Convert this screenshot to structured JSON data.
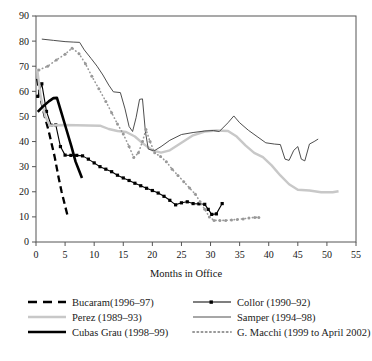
{
  "chart_data": {
    "type": "line",
    "title": "",
    "xlabel": "Months in Office",
    "ylabel": "",
    "xlim": [
      0,
      55
    ],
    "ylim": [
      0,
      90
    ],
    "xticks": [
      0,
      5,
      10,
      15,
      20,
      25,
      30,
      35,
      40,
      45,
      50,
      55
    ],
    "yticks": [
      0,
      10,
      20,
      30,
      40,
      50,
      60,
      70,
      80,
      90
    ],
    "grid": false,
    "legend_position": "below-axis",
    "series": [
      {
        "name": "Bucaram (1996–97)",
        "label": "Bucaram(1996–97)",
        "style": "dashed",
        "color": "#000000",
        "marker": "none",
        "width": 2.3,
        "points": [
          [
            0.2,
            65.0
          ],
          [
            0.7,
            58.0
          ],
          [
            1.5,
            50.0
          ],
          [
            2.2,
            44.0
          ],
          [
            3.2,
            34.0
          ],
          [
            3.9,
            25.5
          ],
          [
            4.4,
            20.0
          ],
          [
            5.1,
            13.5
          ],
          [
            5.5,
            9.8
          ]
        ]
      },
      {
        "name": "Collor (1990–92)",
        "label": "Collor (1990–92)",
        "style": "solid",
        "color": "#000000",
        "marker": "square",
        "width": 1.1,
        "points": [
          [
            0.3,
            58.0
          ],
          [
            1.0,
            63.0
          ],
          [
            1.8,
            52.0
          ],
          [
            2.6,
            46.5
          ],
          [
            3.4,
            46.6
          ],
          [
            4.2,
            38.0
          ],
          [
            5.0,
            34.6
          ],
          [
            6.0,
            34.5
          ],
          [
            7.0,
            34.5
          ],
          [
            8.0,
            34.3
          ],
          [
            9.0,
            33.0
          ],
          [
            10.0,
            31.5
          ],
          [
            11.0,
            30.0
          ],
          [
            12.0,
            29.0
          ],
          [
            13.0,
            28.0
          ],
          [
            14.0,
            26.6
          ],
          [
            15.0,
            25.5
          ],
          [
            16.0,
            24.5
          ],
          [
            17.0,
            23.4
          ],
          [
            18.0,
            22.4
          ],
          [
            19.0,
            21.4
          ],
          [
            20.0,
            20.5
          ],
          [
            21.0,
            19.5
          ],
          [
            22.0,
            18.2
          ],
          [
            23.0,
            16.6
          ],
          [
            24.0,
            14.8
          ],
          [
            25.0,
            15.6
          ],
          [
            26.0,
            16.0
          ],
          [
            27.0,
            15.3
          ],
          [
            28.0,
            15.2
          ],
          [
            29.0,
            15.0
          ],
          [
            29.6,
            13.0
          ],
          [
            30.2,
            11.0
          ],
          [
            31.0,
            11.2
          ],
          [
            32.0,
            15.3
          ]
        ]
      },
      {
        "name": "Perez (1989–93)",
        "label": "Perez (1989–93)",
        "style": "solid",
        "color": "#c8c8c8",
        "marker": "none",
        "width": 2.4,
        "points": [
          [
            0.2,
            69.0
          ],
          [
            0.8,
            58.0
          ],
          [
            1.6,
            50.0
          ],
          [
            2.4,
            46.3
          ],
          [
            3.5,
            46.5
          ],
          [
            5.0,
            46.6
          ],
          [
            7.0,
            46.5
          ],
          [
            9.0,
            46.4
          ],
          [
            11.0,
            46.3
          ],
          [
            12.5,
            45.0
          ],
          [
            14.0,
            44.2
          ],
          [
            15.5,
            43.8
          ],
          [
            17.0,
            42.0
          ],
          [
            18.5,
            39.0
          ],
          [
            20.0,
            36.5
          ],
          [
            21.5,
            35.6
          ],
          [
            23.0,
            36.5
          ],
          [
            25.0,
            39.5
          ],
          [
            27.0,
            42.5
          ],
          [
            29.0,
            44.0
          ],
          [
            31.0,
            44.4
          ],
          [
            33.0,
            44.2
          ],
          [
            34.5,
            42.0
          ],
          [
            36.0,
            38.5
          ],
          [
            37.5,
            35.5
          ],
          [
            39.0,
            33.8
          ],
          [
            40.5,
            30.5
          ],
          [
            42.0,
            26.5
          ],
          [
            43.5,
            23.0
          ],
          [
            45.0,
            20.8
          ],
          [
            47.0,
            20.5
          ],
          [
            49.0,
            19.8
          ],
          [
            51.0,
            19.8
          ],
          [
            52.0,
            20.2
          ]
        ]
      },
      {
        "name": "Samper (1994–98)",
        "label": "Samper (1994–98)",
        "style": "solid",
        "color": "#3a3a3a",
        "marker": "none",
        "width": 0.9,
        "points": [
          [
            1.0,
            80.8
          ],
          [
            3.0,
            80.3
          ],
          [
            5.0,
            79.8
          ],
          [
            6.5,
            79.6
          ],
          [
            7.5,
            79.5
          ],
          [
            8.3,
            76.5
          ],
          [
            9.5,
            73.0
          ],
          [
            10.5,
            70.0
          ],
          [
            11.5,
            66.5
          ],
          [
            12.5,
            62.5
          ],
          [
            13.3,
            59.8
          ],
          [
            14.5,
            59.5
          ],
          [
            15.3,
            53.0
          ],
          [
            16.0,
            46.0
          ],
          [
            16.6,
            44.0
          ],
          [
            17.2,
            49.5
          ],
          [
            17.8,
            56.8
          ],
          [
            18.3,
            57.0
          ],
          [
            18.8,
            44.0
          ],
          [
            19.3,
            37.0
          ],
          [
            20.3,
            36.3
          ],
          [
            21.5,
            38.0
          ],
          [
            23.0,
            40.5
          ],
          [
            25.0,
            42.8
          ],
          [
            27.0,
            43.6
          ],
          [
            29.0,
            44.2
          ],
          [
            30.5,
            44.4
          ],
          [
            31.5,
            44.0
          ],
          [
            33.0,
            47.5
          ],
          [
            34.0,
            50.2
          ],
          [
            35.0,
            47.5
          ],
          [
            36.5,
            44.5
          ],
          [
            38.0,
            42.0
          ],
          [
            39.5,
            39.5
          ],
          [
            41.0,
            39.0
          ],
          [
            42.0,
            38.8
          ],
          [
            42.8,
            33.0
          ],
          [
            43.5,
            32.5
          ],
          [
            44.3,
            36.5
          ],
          [
            45.0,
            38.0
          ],
          [
            45.6,
            33.0
          ],
          [
            46.2,
            32.3
          ],
          [
            47.0,
            39.0
          ],
          [
            47.8,
            40.0
          ],
          [
            48.5,
            41.0
          ]
        ]
      },
      {
        "name": "Cubas Grau (1998–99)",
        "label": "Cubas Grau (1998–99)",
        "style": "solid",
        "color": "#000000",
        "marker": "none",
        "width": 2.6,
        "points": [
          [
            0.3,
            51.8
          ],
          [
            1.2,
            54.0
          ],
          [
            2.2,
            56.0
          ],
          [
            3.0,
            57.3
          ],
          [
            3.6,
            57.4
          ],
          [
            4.3,
            52.0
          ],
          [
            5.2,
            45.0
          ],
          [
            6.1,
            38.0
          ],
          [
            6.8,
            32.0
          ],
          [
            7.4,
            28.5
          ],
          [
            7.9,
            25.5
          ]
        ]
      },
      {
        "name": "G. Macchi (1999 to April 2002)",
        "label": "G. Macchi (1999 to April 2002)",
        "style": "dotted",
        "color": "#999999",
        "marker": "dot",
        "width": 1.6,
        "points": [
          [
            0.5,
            68.5
          ],
          [
            2.0,
            70.0
          ],
          [
            3.5,
            72.5
          ],
          [
            5.0,
            74.8
          ],
          [
            6.2,
            77.2
          ],
          [
            7.4,
            75.0
          ],
          [
            8.5,
            71.0
          ],
          [
            9.6,
            66.0
          ],
          [
            10.8,
            61.0
          ],
          [
            12.0,
            56.0
          ],
          [
            13.0,
            51.5
          ],
          [
            14.0,
            47.0
          ],
          [
            15.0,
            43.0
          ],
          [
            16.0,
            38.0
          ],
          [
            16.8,
            33.7
          ],
          [
            17.6,
            35.5
          ],
          [
            18.3,
            40.0
          ],
          [
            18.9,
            44.8
          ],
          [
            19.6,
            40.0
          ],
          [
            20.4,
            35.5
          ],
          [
            21.4,
            34.0
          ],
          [
            22.4,
            32.0
          ],
          [
            23.4,
            29.0
          ],
          [
            24.4,
            26.5
          ],
          [
            25.4,
            24.0
          ],
          [
            26.4,
            21.5
          ],
          [
            27.4,
            19.0
          ],
          [
            28.2,
            16.0
          ],
          [
            29.0,
            13.0
          ],
          [
            29.8,
            10.0
          ],
          [
            30.6,
            8.6
          ],
          [
            31.6,
            8.6
          ],
          [
            32.6,
            8.6
          ],
          [
            33.6,
            8.8
          ],
          [
            34.6,
            9.0
          ],
          [
            35.6,
            9.2
          ],
          [
            36.6,
            9.6
          ],
          [
            37.6,
            9.8
          ],
          [
            38.3,
            9.8
          ]
        ]
      }
    ]
  },
  "axis": {
    "xlabel": "Months in Office",
    "xticks": [
      "0",
      "5",
      "10",
      "15",
      "20",
      "25",
      "30",
      "35",
      "40",
      "45",
      "50",
      "55"
    ],
    "yticks": [
      "0",
      "10",
      "20",
      "30",
      "40",
      "50",
      "60",
      "70",
      "80",
      "90"
    ]
  },
  "legend": {
    "entries": [
      {
        "label": "Bucaram(1996–97)",
        "swatch": "dashed-black"
      },
      {
        "label": "Collor (1990–92)",
        "swatch": "solid-black-marker"
      },
      {
        "label": "Perez (1989–93)",
        "swatch": "solid-lightgray"
      },
      {
        "label": "Samper (1994–98)",
        "swatch": "solid-thin-gray"
      },
      {
        "label": "Cubas Grau (1998–99)",
        "swatch": "solid-thick-black"
      },
      {
        "label": "G. Macchi (1999 to April 2002)",
        "swatch": "dotted-gray"
      }
    ]
  },
  "colors": {
    "bucaram": "#000000",
    "collor": "#000000",
    "perez": "#c8c8c8",
    "samper": "#3a3a3a",
    "cubas": "#000000",
    "macchi": "#999999",
    "axis": "#555555"
  }
}
